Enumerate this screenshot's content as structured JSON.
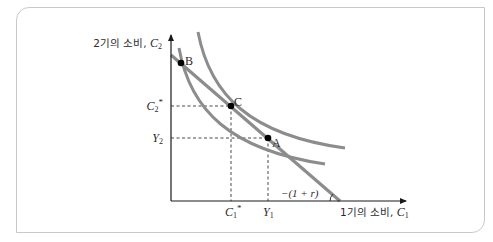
{
  "diagram": {
    "type": "intertemporal-consumption-choice",
    "y_axis_label": {
      "text": "2기의 소비, ",
      "var": "C",
      "sub": "2"
    },
    "x_axis_label": {
      "text": "1기의 소비, ",
      "var": "C",
      "sub": "1"
    },
    "points": [
      {
        "id": "B",
        "label": "B"
      },
      {
        "id": "C",
        "label": "C"
      },
      {
        "id": "A",
        "label": "A"
      }
    ],
    "y_ticks": [
      {
        "var": "C",
        "sub": "2",
        "sup": "*"
      },
      {
        "var": "Y",
        "sub": "2",
        "sup": ""
      }
    ],
    "x_ticks": [
      {
        "var": "C",
        "sub": "1",
        "sup": "*"
      },
      {
        "var": "Y",
        "sub": "1",
        "sup": ""
      }
    ],
    "slope_label": "−(1 + r)",
    "curves": [
      "budget-line",
      "indifference-curve-low",
      "indifference-curve-high"
    ],
    "colors": {
      "curve": "#8c8c8c",
      "axis": "#1a1a1a",
      "frame": "#c9c9c9",
      "text": "#2b2b2b"
    }
  }
}
